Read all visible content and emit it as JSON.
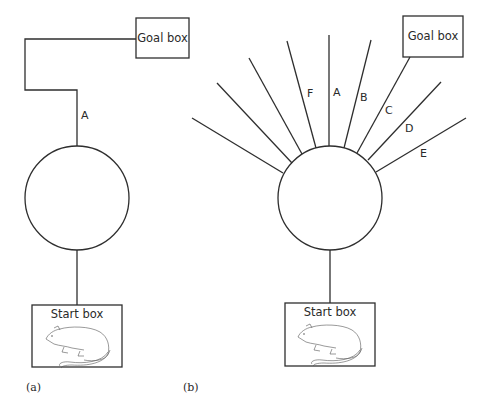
{
  "panel_a": {
    "label": "(a)",
    "goal_box": "Goal box",
    "start_box": "Start box",
    "arm_label": "A"
  },
  "panel_b": {
    "label": "(b)",
    "goal_box": "Goal box",
    "start_box": "Start box",
    "arm_labels": {
      "F": "F",
      "A": "A",
      "B": "B",
      "C": "C",
      "D": "D",
      "E": "E"
    }
  },
  "colors": {
    "line": "#2e2e2e",
    "background": "#ffffff"
  }
}
